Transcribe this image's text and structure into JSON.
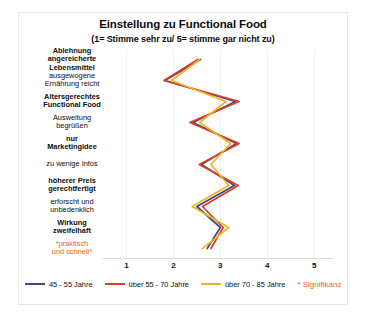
{
  "chart_data": {
    "type": "line",
    "title": "Einstellung zu Functional Food",
    "subtitle": "(1= Stimme sehr zu/ 5= stimme gar nicht zu)",
    "orientation": "horizontal-categories",
    "xlabel": "",
    "ylabel": "",
    "xlim": [
      0.5,
      5.4
    ],
    "xticks": [
      1,
      2,
      3,
      4,
      5
    ],
    "xticklabels": [
      "1",
      "2",
      "3",
      "4",
      "5"
    ],
    "grid": true,
    "legend_position": "bottom",
    "categories": [
      "Ablehnung angereicherte Lebensmittel",
      "ausgewogene Ernährung reicht",
      "Altersgerechtes Functional Food",
      "Ausweitung begrüßen",
      "nur Marketingidee",
      "zu wenige Infos",
      "höherer Preis gerechtfertigt",
      "erforscht und unbedenklich",
      "Wirkung zweifelhaft",
      "*praktisch und schnell*"
    ],
    "category_label_lines": [
      [
        "Ablehnung",
        "angereicherte",
        "Lebensmittel"
      ],
      [
        "ausgewogene",
        "Ernährung reicht"
      ],
      [
        "Altersgerechtes",
        "Functional Food"
      ],
      [
        "Ausweitung",
        "begrüßen"
      ],
      [
        "nur",
        "Marketingidee"
      ],
      [
        "zu wenige Infos"
      ],
      [
        "höherer Preis",
        "gerechtfertigt"
      ],
      [
        "erforscht und",
        "unbedenklich"
      ],
      [
        "Wirkung",
        "zweifelhaft"
      ],
      [
        "*praktisch",
        "und schnell*"
      ]
    ],
    "series": [
      {
        "name": "45 - 55 Jahre",
        "color": "#3b4a85",
        "values": [
          2.58,
          1.82,
          3.32,
          2.42,
          3.34,
          2.6,
          3.3,
          2.5,
          3.0,
          2.72
        ]
      },
      {
        "name": "über 55 - 70 Jahre",
        "color": "#e03a24",
        "values": [
          2.52,
          1.8,
          3.4,
          2.35,
          3.4,
          2.55,
          3.38,
          2.62,
          3.06,
          2.8
        ]
      },
      {
        "name": "über 70 - 85 Jahre",
        "color": "#f0b323",
        "values": [
          2.56,
          1.96,
          3.12,
          2.56,
          3.22,
          2.8,
          3.18,
          2.4,
          3.18,
          2.62
        ]
      }
    ],
    "annotations": [
      {
        "text": "* Signifikanz",
        "color": "#e8622a"
      }
    ]
  },
  "legend": {
    "items": [
      {
        "label": "45 - 55 Jahre",
        "color": "#3b4a85"
      },
      {
        "label": "über 55 - 70 Jahre",
        "color": "#e03a24"
      },
      {
        "label": "über 70 - 85 Jahre",
        "color": "#f0b323"
      }
    ],
    "significance_note": "* Signifikanz",
    "significance_color": "#e8622a"
  }
}
